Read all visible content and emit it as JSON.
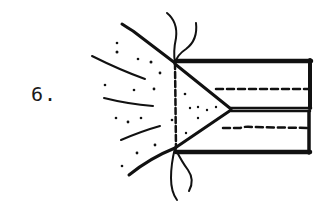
{
  "figure": {
    "step_label": "6.",
    "colors": {
      "ink": "#111111",
      "background": "#ffffff"
    },
    "elements": {
      "strip_upper": {
        "x": 175,
        "y": 61,
        "width": 137,
        "height": 47
      },
      "strip_lower": {
        "x": 175,
        "y": 111,
        "width": 137,
        "height": 42
      },
      "tip_triangle": [
        [
          175,
          64
        ],
        [
          231,
          108
        ],
        [
          175,
          148
        ]
      ],
      "fold_line_dashed": {
        "x": 175,
        "y1": 62,
        "y2": 148
      },
      "stitch_line_upper": {
        "x1": 215,
        "x2": 310,
        "y": 89
      },
      "stitch_line_lower": {
        "x1": 222,
        "x2": 308,
        "y": 128
      },
      "thread_top": true,
      "thread_bottom": true,
      "fan_strokes": 3,
      "fan_dots": 22
    }
  }
}
